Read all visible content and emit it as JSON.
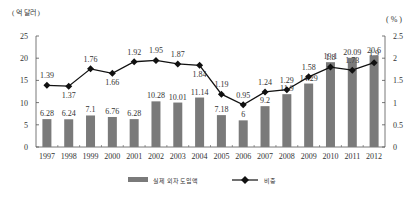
{
  "chart_data": {
    "type": "bar+line",
    "title": "",
    "left_axis_unit": "( 억 달러 )",
    "right_axis_unit": "( % )",
    "categories": [
      "1997",
      "1998",
      "1999",
      "2000",
      "2001",
      "2002",
      "2003",
      "2004",
      "2005",
      "2006",
      "2007",
      "2008",
      "2009",
      "2010",
      "2011",
      "2012"
    ],
    "series": [
      {
        "name": "실제 외자 도입액",
        "type": "bar",
        "axis": "left",
        "color": "#7a7a7a",
        "values": [
          6.28,
          6.24,
          7.1,
          6.76,
          6.28,
          10.28,
          10.01,
          11.14,
          7.18,
          6,
          9.2,
          11.9,
          14.29,
          19.1,
          20.09,
          20.6
        ],
        "labels": [
          "6.28",
          "6.24",
          "7.1",
          "6.76",
          "6.28",
          "10.28",
          "10.01",
          "11.14",
          "7.18",
          "6",
          "9.2",
          "11.9",
          "14.29",
          "19.1",
          "20.09",
          "20.6"
        ]
      },
      {
        "name": "비중",
        "type": "line",
        "axis": "right",
        "color": "#111111",
        "marker": "diamond",
        "values": [
          1.39,
          1.37,
          1.76,
          1.66,
          1.92,
          1.95,
          1.87,
          1.84,
          1.19,
          0.95,
          1.24,
          1.29,
          1.58,
          1.8,
          1.73,
          1.9
        ],
        "labels": [
          "1.39",
          "1.37",
          "1.76",
          "1.66",
          "1.92",
          "1.95",
          "1.87",
          "1.84",
          "1.19",
          "0.95",
          "1.24",
          "1.29",
          "1.58",
          "1.8",
          "1.73",
          "1.9"
        ]
      }
    ],
    "left_axis": {
      "ylim": [
        0,
        25
      ],
      "ticks": [
        "0",
        "5",
        "10",
        "15",
        "20",
        "25"
      ]
    },
    "right_axis": {
      "ylim": [
        0,
        2.5
      ],
      "ticks": [
        "0",
        "0.5",
        "1",
        "1.5",
        "2",
        "2.5"
      ]
    },
    "grid": false,
    "legend_position": "bottom"
  }
}
